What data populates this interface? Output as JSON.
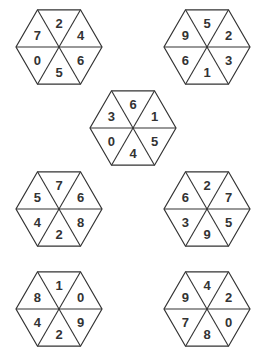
{
  "puzzle": {
    "layout_order": "top, upper-right, lower-right, bottom, lower-left, upper-left",
    "hexagons": [
      {
        "id": "hex-1",
        "cx": 59,
        "cy": 47,
        "values": [
          "2",
          "4",
          "6",
          "5",
          "0",
          "7"
        ]
      },
      {
        "id": "hex-2",
        "cx": 207,
        "cy": 47,
        "values": [
          "5",
          "2",
          "3",
          "1",
          "6",
          "9"
        ]
      },
      {
        "id": "hex-3",
        "cx": 133,
        "cy": 128,
        "values": [
          "6",
          "1",
          "5",
          "4",
          "0",
          "3"
        ]
      },
      {
        "id": "hex-4",
        "cx": 59,
        "cy": 209,
        "values": [
          "7",
          "6",
          "8",
          "2",
          "4",
          "5"
        ]
      },
      {
        "id": "hex-5",
        "cx": 207,
        "cy": 209,
        "values": [
          "2",
          "7",
          "5",
          "9",
          "3",
          "6"
        ]
      },
      {
        "id": "hex-6",
        "cx": 59,
        "cy": 309,
        "values": [
          "1",
          "0",
          "9",
          "2",
          "4",
          "8"
        ]
      },
      {
        "id": "hex-7",
        "cx": 207,
        "cy": 309,
        "values": [
          "4",
          "2",
          "0",
          "8",
          "7",
          "9"
        ]
      }
    ]
  }
}
